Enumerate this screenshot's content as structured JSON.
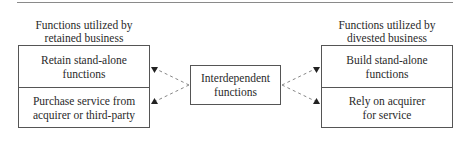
{
  "left": {
    "caption_line1": "Functions utilized by",
    "caption_line2": "retained business",
    "cells": [
      {
        "line1": "Retain stand-alone",
        "line2": "functions"
      },
      {
        "line1": "Purchase service from",
        "line2": "acquirer or third-party"
      }
    ]
  },
  "center": {
    "line1": "Interdependent",
    "line2": "functions"
  },
  "right": {
    "caption_line1": "Functions utilized by",
    "caption_line2": "divested business",
    "cells": [
      {
        "line1": "Build stand-alone",
        "line2": "functions"
      },
      {
        "line1": "Rely on acquirer",
        "line2": "for service"
      }
    ]
  },
  "colors": {
    "line": "#555555",
    "dashed": "#888888",
    "arrow": "#222222"
  }
}
